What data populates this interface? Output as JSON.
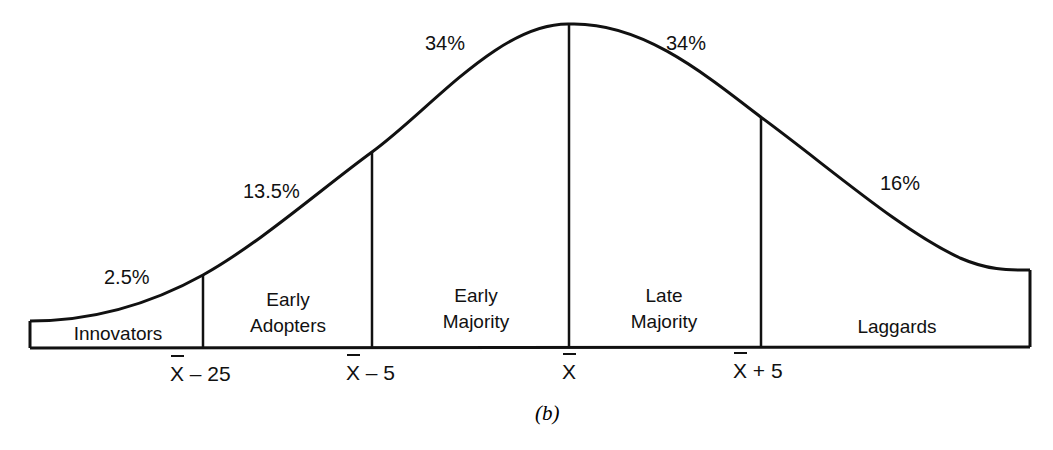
{
  "diagram": {
    "caption": "(b)",
    "segments": [
      {
        "name": "Innovators",
        "lines": [
          "Innovators"
        ],
        "percent": "2.5%"
      },
      {
        "name": "Early Adopters",
        "lines": [
          "Early",
          "Adopters"
        ],
        "percent": "13.5%"
      },
      {
        "name": "Early Majority",
        "lines": [
          "Early",
          "Majority"
        ],
        "percent": "34%"
      },
      {
        "name": "Late Majority",
        "lines": [
          "Late",
          "Majority"
        ],
        "percent": "34%"
      },
      {
        "name": "Laggards",
        "lines": [
          "Laggards"
        ],
        "percent": "16%"
      }
    ],
    "ticks": [
      {
        "sym": "X",
        "suffix": " – 25"
      },
      {
        "sym": "X",
        "suffix": " – 5"
      },
      {
        "sym": "X",
        "suffix": ""
      },
      {
        "sym": "X",
        "suffix": " + 5"
      }
    ],
    "colors": {
      "stroke": "#111111",
      "background": "#ffffff"
    }
  }
}
